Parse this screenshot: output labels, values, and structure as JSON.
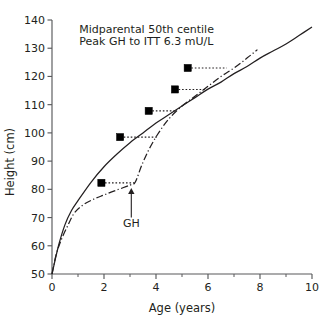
{
  "chart_data": {
    "type": "line",
    "title": "",
    "xlabel": "Age (years)",
    "ylabel": "Height (cm)",
    "xlim": [
      0,
      10
    ],
    "ylim": [
      50,
      140
    ],
    "xticks": [
      0,
      1,
      2,
      3,
      4,
      5,
      6,
      7,
      8,
      9,
      10
    ],
    "xtick_labels": [
      "0",
      "",
      "2",
      "",
      "4",
      "",
      "6",
      "",
      "8",
      "",
      "10"
    ],
    "yticks": [
      50,
      60,
      70,
      80,
      90,
      100,
      110,
      120,
      130,
      140
    ],
    "ytick_labels": [
      "50",
      "60",
      "70",
      "80",
      "90",
      "100",
      "110",
      "120",
      "130",
      "140"
    ],
    "grid": false,
    "legend": "none",
    "series": [
      {
        "name": "Midparental 50th centile",
        "style": "solid",
        "points": [
          {
            "x": 0.0,
            "y": 50.0
          },
          {
            "x": 0.25,
            "y": 60.0
          },
          {
            "x": 0.5,
            "y": 67.5
          },
          {
            "x": 0.75,
            "y": 72.5
          },
          {
            "x": 1.0,
            "y": 76.0
          },
          {
            "x": 1.5,
            "y": 82.5
          },
          {
            "x": 2.0,
            "y": 88.0
          },
          {
            "x": 2.5,
            "y": 92.5
          },
          {
            "x": 3.0,
            "y": 96.5
          },
          {
            "x": 3.5,
            "y": 100.0
          },
          {
            "x": 4.0,
            "y": 103.5
          },
          {
            "x": 4.5,
            "y": 106.5
          },
          {
            "x": 5.0,
            "y": 109.5
          },
          {
            "x": 5.5,
            "y": 112.5
          },
          {
            "x": 6.0,
            "y": 115.5
          },
          {
            "x": 6.5,
            "y": 118.0
          },
          {
            "x": 7.0,
            "y": 121.0
          },
          {
            "x": 7.5,
            "y": 123.5
          },
          {
            "x": 8.0,
            "y": 126.5
          },
          {
            "x": 8.5,
            "y": 129.0
          },
          {
            "x": 9.0,
            "y": 131.5
          },
          {
            "x": 9.5,
            "y": 134.5
          },
          {
            "x": 10.0,
            "y": 137.5
          }
        ]
      },
      {
        "name": "Patient height",
        "style": "dash-dot",
        "points": [
          {
            "x": 0.0,
            "y": 50.0
          },
          {
            "x": 0.15,
            "y": 56.5
          },
          {
            "x": 0.35,
            "y": 62.0
          },
          {
            "x": 0.6,
            "y": 67.0
          },
          {
            "x": 0.85,
            "y": 71.5
          },
          {
            "x": 1.2,
            "y": 74.5
          },
          {
            "x": 1.6,
            "y": 76.5
          },
          {
            "x": 2.0,
            "y": 78.0
          },
          {
            "x": 2.5,
            "y": 79.8
          },
          {
            "x": 3.0,
            "y": 81.5
          },
          {
            "x": 3.2,
            "y": 82.5
          },
          {
            "x": 3.45,
            "y": 88.5
          },
          {
            "x": 3.75,
            "y": 94.5
          },
          {
            "x": 4.1,
            "y": 100.0
          },
          {
            "x": 4.5,
            "y": 105.0
          },
          {
            "x": 5.0,
            "y": 109.5
          },
          {
            "x": 5.5,
            "y": 113.0
          },
          {
            "x": 6.0,
            "y": 116.5
          },
          {
            "x": 6.5,
            "y": 120.0
          },
          {
            "x": 7.0,
            "y": 123.0
          },
          {
            "x": 7.5,
            "y": 126.5
          },
          {
            "x": 7.9,
            "y": 129.5
          }
        ]
      }
    ],
    "markers": {
      "name": "Measured height",
      "shape": "filled-square",
      "points": [
        {
          "x": 1.9,
          "y": 82.3,
          "connector_to_x": 3.2
        },
        {
          "x": 2.62,
          "y": 98.5,
          "connector_to_x": 4.1
        },
        {
          "x": 3.72,
          "y": 107.8,
          "connector_to_x": 4.78
        },
        {
          "x": 4.73,
          "y": 115.4,
          "connector_to_x": 5.9
        },
        {
          "x": 5.22,
          "y": 123.0,
          "connector_to_x": 6.72
        }
      ]
    },
    "annotations": [
      {
        "name": "midparental-note",
        "text": "Midparental 50th centile",
        "x": 1.05,
        "y": 135.5
      },
      {
        "name": "peak-gh-note",
        "text": "Peak GH to ITT 6.3 mU/L",
        "x": 1.05,
        "y": 131.2
      },
      {
        "name": "gh-arrow-label",
        "text": "GH",
        "x": 3.05,
        "y": 66.5,
        "arrow_from_y": 70.0,
        "arrow_to_y": 80.5,
        "arrow_x": 3.05
      }
    ]
  }
}
